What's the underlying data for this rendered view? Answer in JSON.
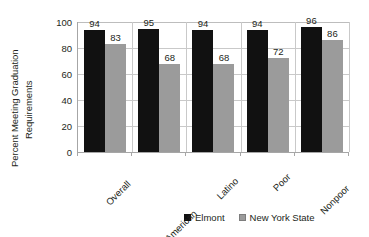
{
  "chart_data": {
    "type": "bar",
    "title": "",
    "subtitle": "",
    "xlabel": "",
    "ylabel": "Percent Meeting Graduation Requirements",
    "ylabel_lines": [
      "Percent Meeting Graduation",
      "Requirements"
    ],
    "categories": [
      "Overall",
      "African American",
      "Latino",
      "Poor",
      "Nonpoor"
    ],
    "series": [
      {
        "name": "Elmont",
        "values": [
          94,
          95,
          94,
          94,
          96
        ],
        "color": "#111111"
      },
      {
        "name": "New York State",
        "values": [
          83,
          68,
          68,
          72,
          86
        ],
        "color": "#9b9b9b"
      }
    ],
    "ylim": [
      0,
      100
    ],
    "yticks": [
      0,
      20,
      40,
      60,
      80,
      100
    ],
    "ytick_labels": [
      "0",
      "20",
      "40",
      "60",
      "80",
      "100"
    ],
    "grid": "horizontal-and-category-separators",
    "legend_position": "bottom-center",
    "data_labels_shown": true
  },
  "legend": {
    "entries": [
      {
        "label": "Elmont"
      },
      {
        "label": "New York State"
      }
    ]
  }
}
